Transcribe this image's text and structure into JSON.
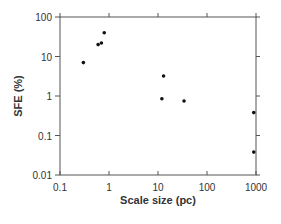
{
  "chart_data": {
    "type": "scatter",
    "title": "",
    "xlabel": "Scale size (pc)",
    "ylabel": "SFE (%)",
    "xscale": "log",
    "yscale": "log",
    "xlim": [
      0.1,
      1000
    ],
    "ylim": [
      0.01,
      100
    ],
    "xticks": [
      "0.1",
      "1",
      "10",
      "100",
      "1000"
    ],
    "yticks": [
      "0.01",
      "0.1",
      "1",
      "10",
      "100"
    ],
    "grid": false,
    "legend": null,
    "series": [
      {
        "name": "SFE vs scale",
        "points": [
          {
            "x": 0.3,
            "y": 7
          },
          {
            "x": 0.6,
            "y": 20
          },
          {
            "x": 0.7,
            "y": 22
          },
          {
            "x": 0.8,
            "y": 40
          },
          {
            "x": 13,
            "y": 3.2
          },
          {
            "x": 12,
            "y": 0.85
          },
          {
            "x": 34,
            "y": 0.75
          },
          {
            "x": 900,
            "y": 0.38
          },
          {
            "x": 900,
            "y": 0.038
          }
        ]
      }
    ]
  },
  "colors": {
    "axis": "#555555",
    "marker": "#111111",
    "text": "#333333"
  }
}
